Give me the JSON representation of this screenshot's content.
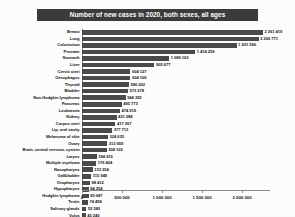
{
  "chart_data": {
    "type": "bar",
    "orientation": "horizontal",
    "title": "Number of new cases in 2020, both sexes, all ages",
    "xlabel": "",
    "ylabel": "",
    "xlim": [
      0,
      2350000
    ],
    "grid": false,
    "legend": null,
    "xticks": [
      "0",
      "500 000",
      "1 000 000",
      "1 500 000",
      "2 000 000"
    ],
    "xtick_values": [
      0,
      500000,
      1000000,
      1500000,
      2000000
    ],
    "categories": [
      "Breast",
      "Lung",
      "Colorectum",
      "Prostate",
      "Stomach",
      "Liver",
      "Cervix uteri",
      "Oesophagus",
      "Thyroid",
      "Bladder",
      "Non-Hodgkin lymphoma",
      "Pancreas",
      "Leukaemia",
      "Kidney",
      "Corpus uteri",
      "Lip, oral cavity",
      "Melanoma of skin",
      "Ovary",
      "Brain, central nervous system",
      "Larynx",
      "Multiple myeloma",
      "Nasopharynx",
      "Gallbladder",
      "Oropharynx",
      "Hypopharynx",
      "Hodgkin lymphoma",
      "Testis",
      "Salivary glands",
      "Vulva",
      "Penis",
      "Kaposi sarcoma",
      "Mesothelioma",
      "Vagina"
    ],
    "values": [
      2261419,
      2206771,
      1931590,
      1414259,
      1089103,
      905677,
      604127,
      604100,
      586202,
      573278,
      544352,
      495773,
      474519,
      431288,
      417367,
      377713,
      324635,
      313959,
      308102,
      184615,
      176404,
      133354,
      115949,
      98412,
      84254,
      83087,
      74458,
      53583,
      45240,
      36068,
      34270,
      30870,
      17908
    ],
    "value_labels": [
      "2 261 419",
      "2 206 771",
      "1 931 590",
      "1 414 259",
      "1 089 103",
      "905 677",
      "604 127",
      "604 100",
      "586 202",
      "573 278",
      "544 352",
      "495 773",
      "474 519",
      "431 288",
      "417 367",
      "377 713",
      "324 635",
      "313 959",
      "308 102",
      "184 615",
      "176 404",
      "133 354",
      "115 949",
      "98 412",
      "84 254",
      "83 087",
      "74 458",
      "53 583",
      "45 240",
      "36 068",
      "34 270",
      "30 870",
      "17 908"
    ],
    "colors": {
      "bar": "#4a4a4a",
      "title_background": "#3b3b3b",
      "title_text": "#ffffff",
      "axis": "#8a8a8a",
      "label_text": "#111111",
      "plot_background": "#fdfdfd"
    }
  }
}
